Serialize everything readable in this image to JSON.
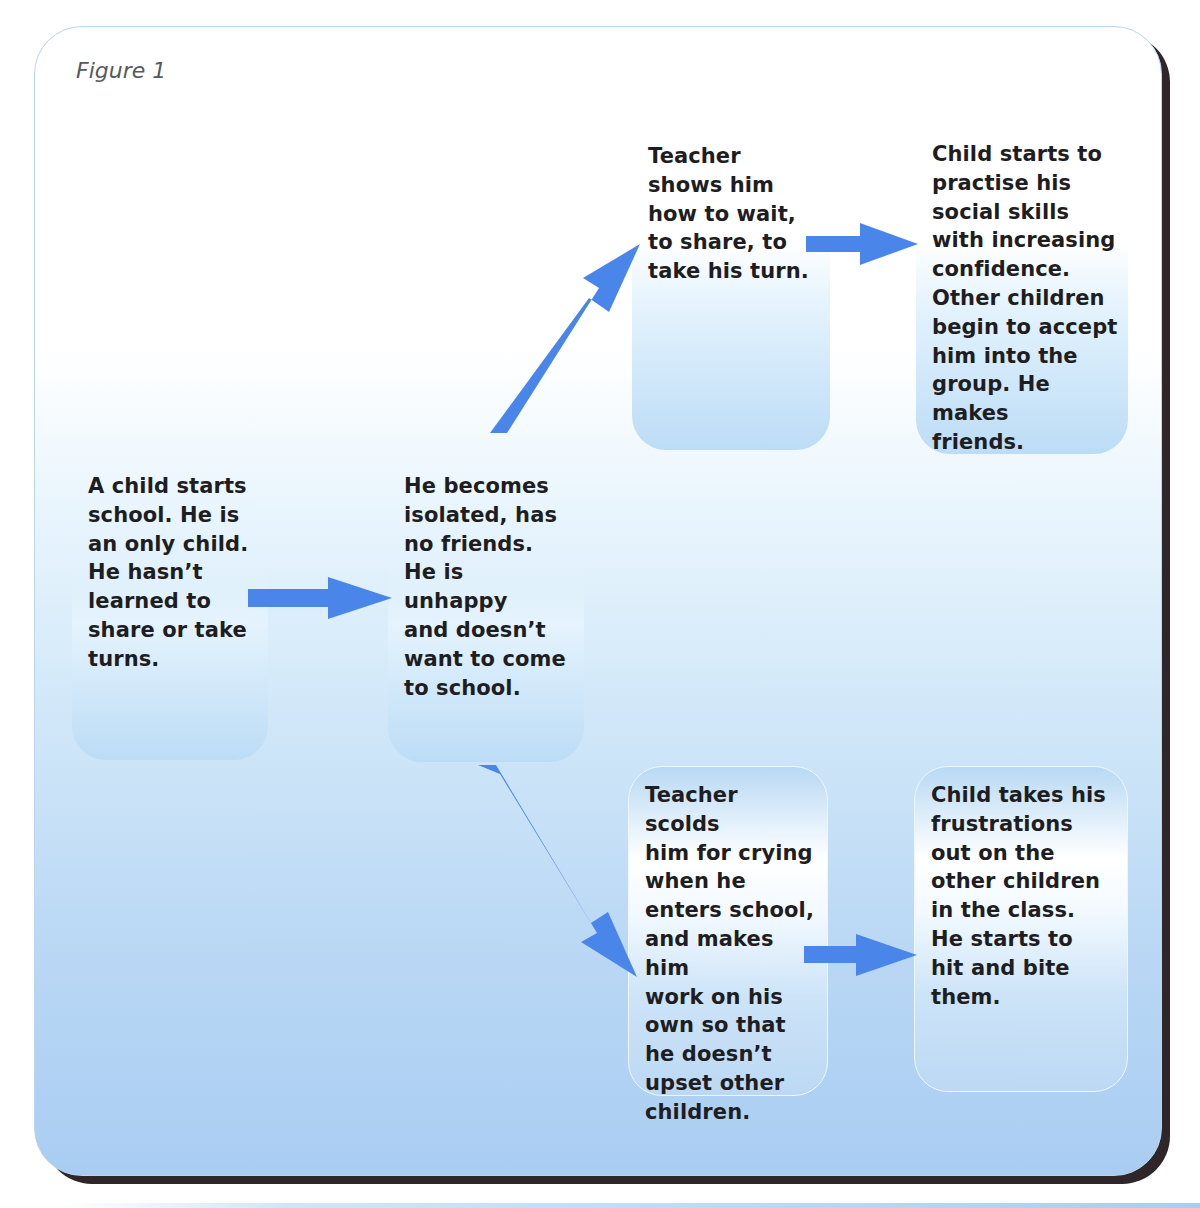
{
  "figure": {
    "label": "Figure 1"
  },
  "nodes": [
    {
      "id": "start",
      "text": "A child starts\nschool. He is\nan only child.\nHe hasn’t\nlearned to\nshare or take\nturns."
    },
    {
      "id": "isolated",
      "text": "He becomes\nisolated, has\nno friends.\nHe is\nunhappy\nand doesn’t\nwant to come\nto school."
    },
    {
      "id": "teacher-shows",
      "text": "Teacher\nshows him\nhow to wait,\nto share, to\ntake his turn."
    },
    {
      "id": "practise-skills",
      "text": "Child starts to\npractise his\nsocial skills\nwith increasing\nconfidence.\nOther children\nbegin to accept\nhim into the\ngroup. He makes\nfriends."
    },
    {
      "id": "teacher-scolds",
      "text": "Teacher scolds\nhim for crying\nwhen he\nenters school,\nand makes him\nwork on his\nown so that\nhe doesn’t\nupset other\nchildren."
    },
    {
      "id": "frustrations",
      "text": "Child takes his\nfrustrations\nout on the\nother children\nin the class.\nHe starts to\nhit and bite\nthem."
    }
  ],
  "edges": [
    {
      "from": "start",
      "to": "isolated"
    },
    {
      "from": "isolated",
      "to": "teacher-shows"
    },
    {
      "from": "teacher-shows",
      "to": "practise-skills"
    },
    {
      "from": "isolated",
      "to": "teacher-scolds"
    },
    {
      "from": "teacher-scolds",
      "to": "frustrations"
    }
  ],
  "colors": {
    "arrow": "#4a86ea",
    "panel_bottom": "#a9cdf2",
    "shadow": "#2e2628",
    "text": "#1e1e22"
  }
}
